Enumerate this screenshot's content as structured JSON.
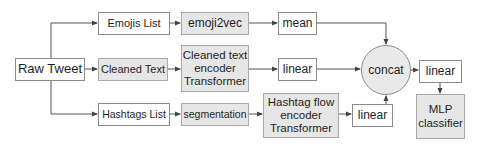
{
  "diagram": {
    "type": "flowchart",
    "colors": {
      "line": "#555555",
      "border": "#8a8a8a",
      "gray_fill": "#e6e6e6",
      "white_fill": "#ffffff"
    },
    "nodes": {
      "raw_tweet": {
        "label": "Raw Tweet",
        "fill": "white"
      },
      "emojis_list": {
        "label": "Emojis List",
        "fill": "white"
      },
      "emoji2vec": {
        "label": "emoji2vec",
        "fill": "gray"
      },
      "mean": {
        "label": "mean",
        "fill": "white"
      },
      "cleaned_text": {
        "label": "Cleaned Text",
        "fill": "gray"
      },
      "cleaned_text_encoder": {
        "label": "Cleaned text\nencoder\nTransformer",
        "fill": "gray"
      },
      "linear_text": {
        "label": "linear",
        "fill": "white"
      },
      "hashtags_list": {
        "label": "Hashtags List",
        "fill": "white"
      },
      "segmentation": {
        "label": "segmentation",
        "fill": "gray"
      },
      "hashtag_flow_encoder": {
        "label": "Hashtag flow\nencoder\nTransformer",
        "fill": "gray"
      },
      "linear_hashtag": {
        "label": "linear",
        "fill": "white"
      },
      "concat": {
        "label": "concat",
        "shape": "circle"
      },
      "linear_out": {
        "label": "linear",
        "fill": "white"
      },
      "mlp_classifier": {
        "label": "MLP\nclassifier",
        "fill": "gray"
      }
    },
    "edges": [
      [
        "raw_tweet",
        "emojis_list"
      ],
      [
        "raw_tweet",
        "cleaned_text"
      ],
      [
        "raw_tweet",
        "hashtags_list"
      ],
      [
        "emojis_list",
        "emoji2vec"
      ],
      [
        "emoji2vec",
        "mean"
      ],
      [
        "mean",
        "concat"
      ],
      [
        "cleaned_text",
        "cleaned_text_encoder"
      ],
      [
        "cleaned_text_encoder",
        "linear_text"
      ],
      [
        "linear_text",
        "concat"
      ],
      [
        "hashtags_list",
        "segmentation"
      ],
      [
        "segmentation",
        "hashtag_flow_encoder"
      ],
      [
        "hashtag_flow_encoder",
        "linear_hashtag"
      ],
      [
        "linear_hashtag",
        "concat"
      ],
      [
        "concat",
        "linear_out"
      ],
      [
        "linear_out",
        "mlp_classifier"
      ]
    ]
  }
}
